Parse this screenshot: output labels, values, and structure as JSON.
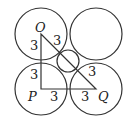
{
  "diagram": {
    "points": {
      "O": {
        "label": "O",
        "x": 41,
        "y": 34
      },
      "P": {
        "label": "P",
        "x": 41,
        "y": 89
      },
      "Q": {
        "label": "Q",
        "x": 96,
        "y": 89
      }
    },
    "big_circles": [
      {
        "cx": 41,
        "cy": 34,
        "r": 26
      },
      {
        "cx": 96,
        "cy": 34,
        "r": 26
      },
      {
        "cx": 41,
        "cy": 89,
        "r": 26
      },
      {
        "cx": 96,
        "cy": 89,
        "r": 26
      }
    ],
    "small_circle": {
      "cx": 68,
      "cy": 61,
      "r": 12
    },
    "segment_labels": {
      "op_upper": "3",
      "op_lower": "3",
      "oq_upper": "3",
      "oq_lower": "3",
      "pq_left": "3",
      "pq_right": "3"
    },
    "stroke_color": "#333333"
  }
}
